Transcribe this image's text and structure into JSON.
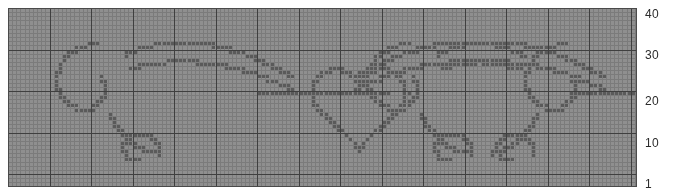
{
  "chart_data": {
    "type": "heatmap",
    "title": "",
    "subtitle": "",
    "xlabel": "",
    "ylabel": "",
    "grid": true,
    "legend_position": "none",
    "cell_size_px": 4.15,
    "columns": 151,
    "rows": 43,
    "xlim": [
      1,
      151
    ],
    "ylim": [
      1,
      43
    ],
    "axis_side": "right",
    "tick_values": [
      1,
      10,
      20,
      30,
      40
    ],
    "tick_labels": [
      "1",
      "10",
      "20",
      "30",
      "40"
    ],
    "colors": {
      "plot_background": "#8f8f8f",
      "minor_grid": "#7b7b7b",
      "major_grid": "#3f3f3f",
      "stitch": "#5a5a5a",
      "page_background": "#ffffff",
      "tick_text": "#2b2b2b"
    },
    "major_grid_every": 10,
    "stitch_color_count": 1,
    "series": [
      {
        "name": "filigree-scroll-pattern",
        "symbol": "filled-square",
        "color": "#5a5a5a",
        "stitch_count": 1088
      }
    ]
  },
  "axis": {
    "ticks": [
      {
        "value": 40,
        "label": "40"
      },
      {
        "value": 30,
        "label": "30"
      },
      {
        "value": 20,
        "label": "20"
      },
      {
        "value": 10,
        "label": "10"
      },
      {
        "value": 1,
        "label": "1"
      }
    ]
  }
}
